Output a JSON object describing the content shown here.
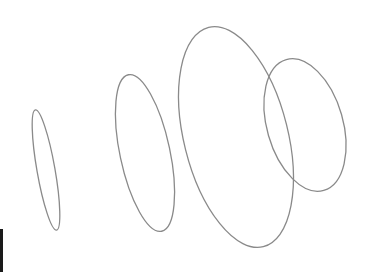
{
  "drawing": {
    "description": "Four hand-sketched outlined ellipses increasing in size from left to right",
    "stroke_color": "#8a8a8a",
    "stroke_width": 1.3,
    "background": "#ffffff",
    "ellipses": [
      {
        "cx": 46,
        "cy": 170,
        "rx": 9,
        "ry": 61,
        "rotate": -10
      },
      {
        "cx": 145,
        "cy": 153,
        "rx": 25,
        "ry": 80,
        "rotate": -12
      },
      {
        "cx": 236,
        "cy": 137,
        "rx": 52,
        "ry": 113,
        "rotate": -14
      },
      {
        "cx": 305,
        "cy": 125,
        "rx": 38,
        "ry": 68,
        "rotate": -16
      }
    ],
    "edge_mark": {
      "color": "#1a1a1a"
    }
  }
}
